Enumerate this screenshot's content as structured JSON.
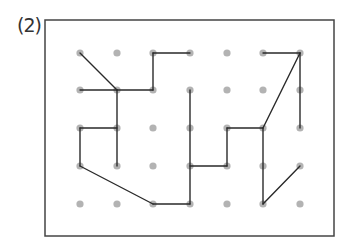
{
  "problem_label": "(2)",
  "colors": {
    "frame": "#444444",
    "dot": "#b3b3b3",
    "line": "#2a2a2a"
  },
  "grid": {
    "columns": [
      80,
      117,
      153,
      190,
      227,
      263,
      300
    ],
    "rows": [
      53,
      90,
      128,
      166,
      204
    ]
  },
  "frame": {
    "x": 45,
    "y": 20,
    "width": 289,
    "height": 216
  },
  "segments": [
    [
      [
        0,
        0
      ],
      [
        1,
        1
      ]
    ],
    [
      [
        0,
        1
      ],
      [
        1,
        1
      ]
    ],
    [
      [
        1,
        1
      ],
      [
        2,
        1
      ]
    ],
    [
      [
        2,
        1
      ],
      [
        2,
        0
      ]
    ],
    [
      [
        2,
        0
      ],
      [
        3,
        0
      ]
    ],
    [
      [
        1,
        1
      ],
      [
        1,
        3
      ]
    ],
    [
      [
        0,
        2
      ],
      [
        1,
        2
      ]
    ],
    [
      [
        0,
        2
      ],
      [
        0,
        3
      ]
    ],
    [
      [
        0,
        3
      ],
      [
        2,
        4
      ]
    ],
    [
      [
        2,
        4
      ],
      [
        3,
        4
      ]
    ],
    [
      [
        3,
        4
      ],
      [
        3,
        1
      ]
    ],
    [
      [
        3,
        3
      ],
      [
        4,
        3
      ]
    ],
    [
      [
        4,
        3
      ],
      [
        4,
        2
      ]
    ],
    [
      [
        4,
        2
      ],
      [
        5,
        2
      ]
    ],
    [
      [
        5,
        2
      ],
      [
        6,
        0
      ]
    ],
    [
      [
        5,
        0
      ],
      [
        6,
        0
      ]
    ],
    [
      [
        6,
        0
      ],
      [
        6,
        2
      ]
    ],
    [
      [
        5,
        2
      ],
      [
        5,
        4
      ]
    ],
    [
      [
        5,
        4
      ],
      [
        6,
        3
      ]
    ]
  ]
}
